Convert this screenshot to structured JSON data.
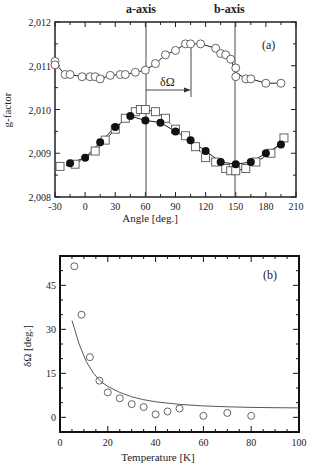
{
  "chart_data": [
    {
      "type": "scatter",
      "panel_label": "(a)",
      "title": "",
      "xlabel": "Angle [deg.]",
      "ylabel": "g-factor",
      "xlim": [
        -30,
        210
      ],
      "ylim": [
        2.008,
        2.012
      ],
      "x_ticks": [
        "-30",
        "0",
        "30",
        "60",
        "90",
        "120",
        "150",
        "180",
        "210"
      ],
      "y_ticks": [
        "2,008",
        "2,009",
        "2,010",
        "2,011",
        "2,012"
      ],
      "annotations": [
        {
          "text": "a-axis",
          "x": 60
        },
        {
          "text": "b-axis",
          "x": 150
        },
        {
          "text": "δΩ",
          "from_x": 60,
          "to_x": 105
        }
      ],
      "grid": false,
      "series": [
        {
          "name": "open circles",
          "marker": "open-circle",
          "points": [
            [
              -30,
              2.0111
            ],
            [
              -30,
              2.01102
            ],
            [
              -20,
              2.0108
            ],
            [
              -15,
              2.0108
            ],
            [
              -3,
              2.01075
            ],
            [
              5,
              2.01075
            ],
            [
              10,
              2.01075
            ],
            [
              15,
              2.0107
            ],
            [
              25,
              2.01078
            ],
            [
              35,
              2.0108
            ],
            [
              40,
              2.0108
            ],
            [
              50,
              2.01085
            ],
            [
              60,
              2.0109
            ],
            [
              70,
              2.01105
            ],
            [
              80,
              2.01125
            ],
            [
              90,
              2.01135
            ],
            [
              100,
              2.0115
            ],
            [
              105,
              2.0115
            ],
            [
              115,
              2.0115
            ],
            [
              130,
              2.0114
            ],
            [
              135,
              2.01128
            ],
            [
              140,
              2.01125
            ],
            [
              145,
              2.01115
            ],
            [
              150,
              2.01095
            ],
            [
              150,
              2.01075
            ],
            [
              160,
              2.0107
            ],
            [
              165,
              2.0107
            ],
            [
              180,
              2.0106
            ],
            [
              195,
              2.0106
            ]
          ]
        },
        {
          "name": "filled circles",
          "marker": "filled-circle",
          "points": [
            [
              -15,
              2.00877
            ],
            [
              0,
              2.0089
            ],
            [
              15,
              2.00925
            ],
            [
              30,
              2.0096
            ],
            [
              45,
              2.00985
            ],
            [
              60,
              2.00975
            ],
            [
              75,
              2.0097
            ],
            [
              90,
              2.0095
            ],
            [
              105,
              2.0093
            ],
            [
              120,
              2.00905
            ],
            [
              135,
              2.0088
            ],
            [
              150,
              2.00875
            ],
            [
              165,
              2.0088
            ],
            [
              180,
              2.009
            ],
            [
              195,
              2.0092
            ]
          ]
        },
        {
          "name": "open squares",
          "marker": "open-square",
          "points": [
            [
              -25,
              2.0087
            ],
            [
              -10,
              2.00875
            ],
            [
              10,
              2.00905
            ],
            [
              20,
              2.0093
            ],
            [
              30,
              2.00955
            ],
            [
              40,
              2.0098
            ],
            [
              50,
              2.00995
            ],
            [
              55,
              2.01
            ],
            [
              60,
              2.01
            ],
            [
              70,
              2.00995
            ],
            [
              80,
              2.0098
            ],
            [
              90,
              2.00955
            ],
            [
              100,
              2.0094
            ],
            [
              110,
              2.00915
            ],
            [
              120,
              2.0089
            ],
            [
              130,
              2.0088
            ],
            [
              140,
              2.00865
            ],
            [
              145,
              2.0086
            ],
            [
              150,
              2.0086
            ],
            [
              160,
              2.00865
            ],
            [
              170,
              2.0088
            ],
            [
              185,
              2.009
            ],
            [
              198,
              2.00935
            ]
          ]
        }
      ]
    },
    {
      "type": "scatter",
      "panel_label": "(b)",
      "title": "",
      "xlabel": "Temperature [K]",
      "ylabel": "δΩ [deg.]",
      "xlim": [
        0,
        100
      ],
      "ylim": [
        -5,
        55
      ],
      "x_ticks": [
        "0",
        "20",
        "40",
        "60",
        "80",
        "100"
      ],
      "y_ticks": [
        "0",
        "15",
        "30",
        "45"
      ],
      "grid": false,
      "series": [
        {
          "name": "data",
          "marker": "open-circle",
          "points": [
            [
              6,
              51.5
            ],
            [
              9,
              35
            ],
            [
              12.5,
              20.5
            ],
            [
              16.5,
              12.5
            ],
            [
              20,
              8.5
            ],
            [
              25,
              6.5
            ],
            [
              30,
              4.5
            ],
            [
              35,
              3.5
            ],
            [
              40,
              1
            ],
            [
              45,
              2
            ],
            [
              50,
              3
            ],
            [
              60,
              0.5
            ],
            [
              70,
              1.5
            ],
            [
              80,
              0.5
            ]
          ]
        },
        {
          "name": "fit",
          "marker": "line",
          "points": [
            [
              5,
              33
            ],
            [
              8,
              25
            ],
            [
              11,
              19
            ],
            [
              14,
              15
            ],
            [
              17,
              12.3
            ],
            [
              20,
              10.5
            ],
            [
              25,
              8.5
            ],
            [
              30,
              7
            ],
            [
              35,
              6
            ],
            [
              40,
              5.3
            ],
            [
              50,
              4.4
            ],
            [
              60,
              3.9
            ],
            [
              70,
              3.6
            ],
            [
              80,
              3.4
            ],
            [
              90,
              3.3
            ],
            [
              100,
              3.2
            ]
          ]
        }
      ]
    }
  ]
}
